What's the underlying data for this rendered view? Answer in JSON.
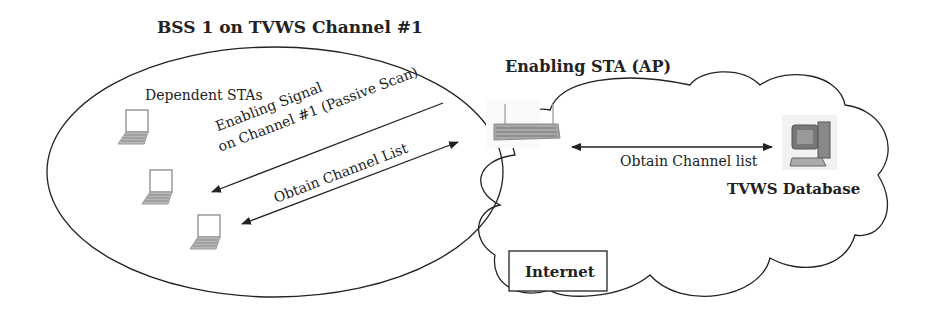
{
  "title": "BSS 1 on TVWS Channel #1",
  "dependent_label": "Dependent STAs",
  "enabling_signal_line1": "Enabling Signal",
  "enabling_signal_line2": "on Channel #1 (Passive Scan)",
  "obtain_list_left": "Obtain Channel List",
  "ap_label": "Enabling STA (AP)",
  "obtain_list_right": "Obtain Channel list",
  "db_label": "TVWS Database",
  "internet_label": "Internet",
  "colors": {
    "line": "#222222",
    "device_gray": "#9a9a9a"
  }
}
